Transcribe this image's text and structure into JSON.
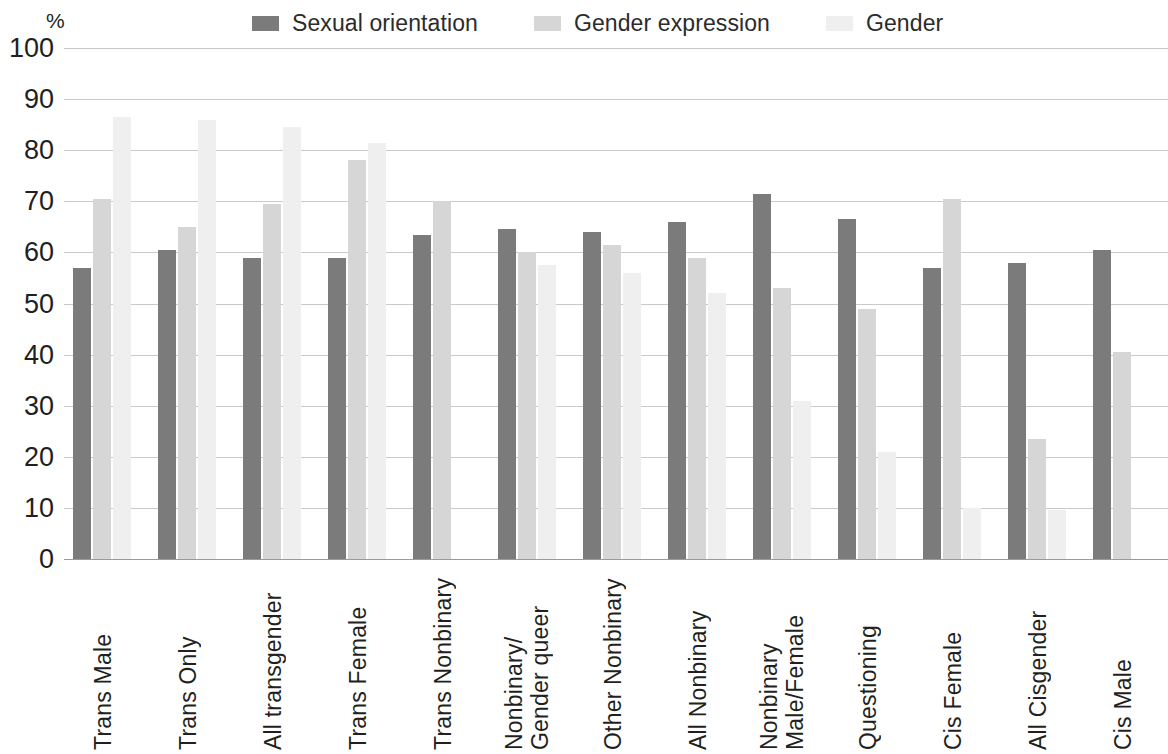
{
  "legend": {
    "items": [
      {
        "label": "Sexual orientation",
        "color": "#7b7b7b",
        "swatch_icon": "legend-swatch-icon"
      },
      {
        "label": "Gender expression",
        "color": "#d6d6d6",
        "swatch_icon": "legend-swatch-icon"
      },
      {
        "label": "Gender",
        "color": "#efefef",
        "swatch_icon": "legend-swatch-icon"
      }
    ]
  },
  "axis": {
    "y_unit": "%",
    "y_ticks": [
      "100",
      "90",
      "80",
      "70",
      "60",
      "50",
      "40",
      "30",
      "20",
      "10",
      "0"
    ]
  },
  "chart_data": {
    "type": "bar",
    "title": "",
    "subtitle": "",
    "xlabel": "",
    "ylabel": "%",
    "ylim": [
      0,
      100
    ],
    "ytick_step": 10,
    "grid": true,
    "legend_position": "top",
    "orientation": "vertical",
    "grouped": true,
    "categories": [
      "Trans Male",
      "Trans Only",
      "All transgender",
      "Trans Female",
      "Trans Nonbinary",
      "Nonbinary/\nGender queer",
      "Other Nonbinary",
      "All Nonbinary",
      "Nonbinary\nMale/Female",
      "Questioning",
      "Cis Female",
      "All Cisgender",
      "Cis Male"
    ],
    "series": [
      {
        "name": "Sexual orientation",
        "color": "#7b7b7b",
        "values": [
          57,
          60.5,
          59,
          59,
          63.5,
          64.5,
          64,
          66,
          71.5,
          66.5,
          57,
          58,
          60.5
        ]
      },
      {
        "name": "Gender expression",
        "color": "#d6d6d6",
        "values": [
          70.5,
          65,
          69.5,
          78,
          70,
          60,
          61.5,
          59,
          53,
          49,
          70.5,
          23.5,
          40.5
        ]
      },
      {
        "name": "Gender",
        "color": "#efefef",
        "values": [
          86.5,
          86,
          84.5,
          81.5,
          0,
          57.5,
          56,
          52,
          31,
          21,
          10,
          9.5,
          0
        ]
      }
    ]
  }
}
